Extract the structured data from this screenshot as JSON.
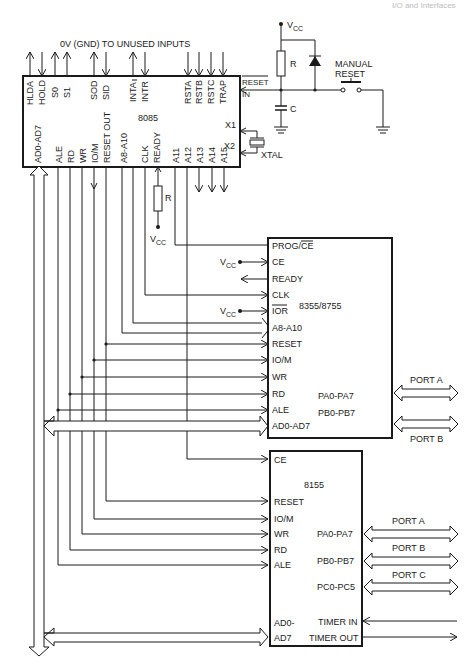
{
  "header": {
    "running_head": "I/O and Interfaces"
  },
  "note": "0V (GND) TO UNUSED INPUTS",
  "cpu": {
    "name": "8085",
    "top_pins": [
      "HLDA",
      "HOLD",
      "S0",
      "S1",
      "SOD",
      "SID",
      "INTA",
      "INTR",
      "RSTA",
      "RSTB",
      "RSTC",
      "TRAP"
    ],
    "right_pins": [
      "RESET IN",
      "X1",
      "X2"
    ],
    "bottom_pins": [
      "AD0-AD7",
      "ALE",
      "RD",
      "WR",
      "IO/M",
      "RESET OUT",
      "A8-A10",
      "CLK",
      "READY",
      "A11",
      "A12",
      "A13",
      "A14",
      "A15"
    ]
  },
  "reset_circuit": {
    "vcc": "VCC",
    "resistor": "R",
    "capacitor": "C",
    "switch": "MANUAL RESET",
    "switch_line1": "MANUAL",
    "switch_line2": "RESET"
  },
  "crystal": "XTAL",
  "ready_pullup": {
    "resistor": "R",
    "vcc": "VCC"
  },
  "rom_chip": {
    "name": "8355/8755",
    "pins": [
      "PROG/CE",
      "CE",
      "READY",
      "CLK",
      "IOR",
      "A8-A10",
      "RESET",
      "IO/M",
      "WR",
      "RD",
      "ALE",
      "AD0-AD7"
    ],
    "ports": [
      {
        "pins": "PA0-PA7",
        "label": "PORT A"
      },
      {
        "pins": "PB0-PB7",
        "label": "PORT B"
      }
    ],
    "vcc": "VCC"
  },
  "ram_chip": {
    "name": "8155",
    "pins": [
      "CE",
      "RESET",
      "IO/M",
      "WR",
      "RD",
      "ALE",
      "AD0-",
      "AD7"
    ],
    "ports": [
      {
        "pins": "PA0-PA7",
        "label": "PORT A"
      },
      {
        "pins": "PB0-PB7",
        "label": "PORT B"
      },
      {
        "pins": "PC0-PC5",
        "label": "PORT C"
      }
    ],
    "timer": [
      "TIMER IN",
      "TIMER OUT"
    ]
  }
}
